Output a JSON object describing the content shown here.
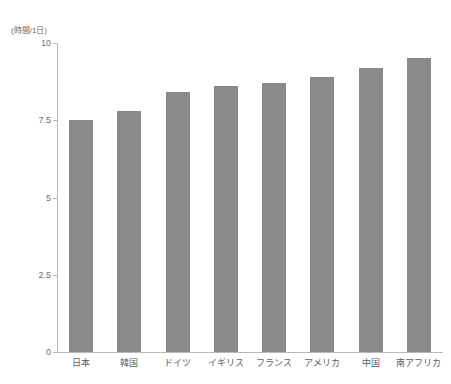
{
  "chart_data": {
    "type": "bar",
    "title": "",
    "subtitle": "",
    "xlabel": "",
    "ylabel": "(時間/1日)",
    "unit_label": "(時間/1日)",
    "categories": [
      "日本",
      "韓国",
      "ドイツ",
      "イギリス",
      "フランス",
      "アメリカ",
      "中国",
      "南アフリカ"
    ],
    "values": [
      7.5,
      7.8,
      8.4,
      8.6,
      8.7,
      8.9,
      9.2,
      9.5
    ],
    "series": [
      {
        "name": "睡眠時間",
        "values": [
          7.5,
          7.8,
          8.4,
          8.6,
          8.7,
          8.9,
          9.2,
          9.5
        ]
      }
    ],
    "ylim": [
      0,
      10
    ],
    "ytick_values": [
      0,
      2.5,
      5,
      7.5,
      10
    ],
    "ytick_labels": [
      "0",
      "2.5",
      "5",
      "7.5",
      "10"
    ],
    "grid": false,
    "legend": false,
    "legend_position": "none",
    "bar_color": "#8a8a8c",
    "axis_color": "#b9b9bb",
    "text_color": "#5d5d5f",
    "background_color": "#ffffff"
  }
}
